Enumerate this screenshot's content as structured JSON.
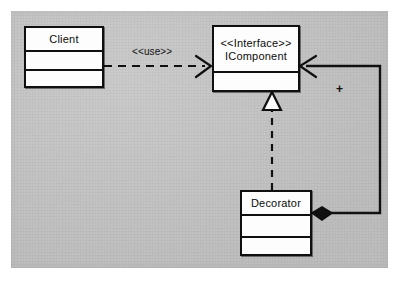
{
  "diagram": {
    "type": "uml-class-diagram",
    "canvas_color": "#c3c3c3",
    "line_color": "#101010",
    "box_fill": "#fdfdfd"
  },
  "classes": {
    "client": {
      "name": "Client",
      "stereotype": "",
      "compartments": [
        "Client",
        "",
        ""
      ]
    },
    "icomponent": {
      "stereotype": "<<Interface>>",
      "name": "IComponent",
      "compartments": [
        "",
        ""
      ]
    },
    "decorator": {
      "name": "Decorator",
      "stereotype": "",
      "compartments": [
        "Decorator",
        "",
        ""
      ]
    }
  },
  "relationships": [
    {
      "id": "use-dependency",
      "kind": "dependency",
      "label": "<<use>>",
      "from": "Client",
      "to": "IComponent",
      "line_style": "dashed",
      "arrowhead": "open"
    },
    {
      "id": "realization",
      "kind": "realization",
      "label": "",
      "from": "Decorator",
      "to": "IComponent",
      "line_style": "dashed",
      "arrowhead": "hollow-triangle"
    },
    {
      "id": "composition",
      "kind": "composition",
      "label": "+",
      "from": "Decorator",
      "to": "IComponent",
      "line_style": "solid",
      "arrowhead": "open",
      "source_decoration": "filled-diamond"
    }
  ],
  "labels": {
    "use": "<<use>>",
    "plus": "+"
  }
}
